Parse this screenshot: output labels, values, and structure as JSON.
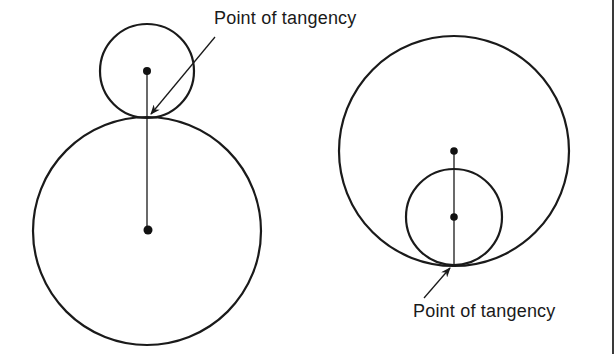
{
  "figure": {
    "stroke_color": "#1a1a1a",
    "background": "#ffffff"
  },
  "external_tangency": {
    "label": "Point of tangency",
    "small_circle": {
      "cx": 147,
      "cy": 71,
      "r": 47
    },
    "large_circle": {
      "cx": 147,
      "cy": 231,
      "r": 114
    },
    "tangent_point": {
      "x": 147,
      "y": 117
    }
  },
  "internal_tangency": {
    "label": "Point of tangency",
    "large_circle": {
      "cx": 454,
      "cy": 151,
      "r": 115
    },
    "small_circle": {
      "cx": 454,
      "cy": 217,
      "r": 48
    },
    "tangent_point": {
      "x": 454,
      "y": 265
    }
  }
}
